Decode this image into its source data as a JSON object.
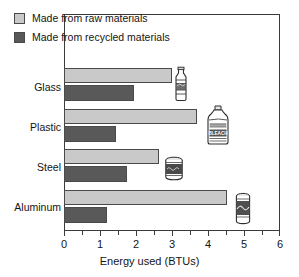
{
  "chart_data": {
    "type": "bar",
    "orientation": "horizontal",
    "title": "",
    "xlabel": "Energy used (BTUs)",
    "ylabel": "",
    "xlim": [
      0,
      6
    ],
    "xticks": [
      0,
      1,
      2,
      3,
      4,
      5,
      6
    ],
    "xticklabels": [
      "0",
      "1",
      "2",
      "3",
      "4",
      "5",
      "6"
    ],
    "grid": false,
    "legend_position": "top-left-inside",
    "categories": [
      "Glass",
      "Plastic",
      "Steel",
      "Aluminum"
    ],
    "series": [
      {
        "name": "Made from raw materials",
        "color": "#c9c9c9",
        "values": [
          3.0,
          3.7,
          2.65,
          4.55
        ]
      },
      {
        "name": "Made from recycled materials",
        "color": "#595959",
        "values": [
          1.95,
          1.45,
          1.75,
          1.2
        ]
      }
    ],
    "annotations": [
      {
        "icon": "glass-bottle-icon",
        "category": "Glass",
        "x": 3.2
      },
      {
        "icon": "bleach-jug-icon",
        "category": "Plastic",
        "x": 4.2
      },
      {
        "icon": "steel-can-icon",
        "category": "Steel",
        "x": 3.0
      },
      {
        "icon": "aluminum-can-icon",
        "category": "Aluminum",
        "x": 4.95
      }
    ]
  },
  "legend": {
    "items": [
      {
        "label": "Made from raw materials",
        "swatch": "raw"
      },
      {
        "label": "Made from recycled materials",
        "swatch": "recycled"
      }
    ]
  },
  "axis": {
    "x_title": "Energy used (BTUs)",
    "tick_labels": [
      "0",
      "1",
      "2",
      "3",
      "4",
      "5",
      "6"
    ],
    "category_labels": [
      "Glass",
      "Plastic",
      "Steel",
      "Aluminum"
    ]
  },
  "colors": {
    "raw": "#c9c9c9",
    "recycled": "#595959",
    "frame": "#3b3b3b",
    "text": "#141414",
    "background": "#ffffff"
  },
  "icon_labels": {
    "bleach_jug_text": "BLEACH"
  }
}
